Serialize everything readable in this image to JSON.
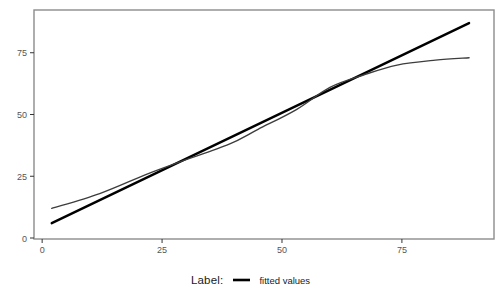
{
  "figure": {
    "width": 501,
    "height": 296,
    "background": "#ffffff",
    "panel_border_color": "#8c8c8c",
    "tick_mark_color": "#333333",
    "tick_label_color": "#555555"
  },
  "legend": {
    "title": "Label:",
    "items": [
      {
        "label": "fitted values",
        "swatch_color": "#000000"
      }
    ]
  },
  "chart_data": {
    "type": "line",
    "title": "",
    "xlabel": "",
    "ylabel": "",
    "xlim": [
      -1.7,
      94.2
    ],
    "ylim": [
      -0.4,
      92.3
    ],
    "x_ticks": [
      0,
      25,
      50,
      75
    ],
    "y_ticks": [
      0,
      25,
      50,
      75
    ],
    "grid": false,
    "legend_position": "bottom",
    "series": [
      {
        "name": "fitted values",
        "color": "#000000",
        "width": 2.4,
        "smooth": false,
        "points": [
          [
            2,
            6
          ],
          [
            89,
            87
          ]
        ]
      },
      {
        "name": "unlabeled-data-curve",
        "color": "#3d3d3d",
        "width": 1.4,
        "smooth": true,
        "points": [
          [
            2,
            12
          ],
          [
            12,
            18
          ],
          [
            22,
            26
          ],
          [
            29,
            31
          ],
          [
            39,
            38
          ],
          [
            45,
            44
          ],
          [
            53,
            52
          ],
          [
            60,
            61
          ],
          [
            67,
            66
          ],
          [
            74,
            70
          ],
          [
            82,
            72
          ],
          [
            89,
            73
          ]
        ]
      }
    ]
  }
}
